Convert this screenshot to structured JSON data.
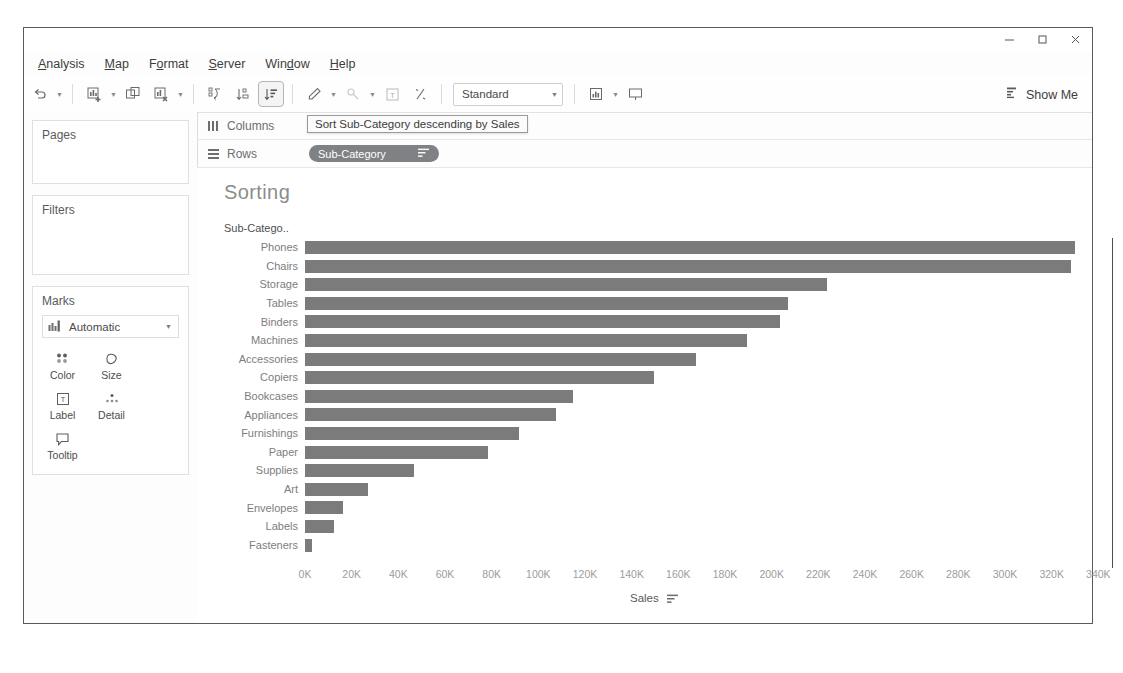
{
  "window": {
    "controls": [
      {
        "name": "minimize",
        "glyph": "—"
      },
      {
        "name": "maximize",
        "glyph": "❐"
      },
      {
        "name": "close",
        "glyph": "✕"
      }
    ]
  },
  "menubar": {
    "items": [
      {
        "label": "Analysis",
        "accel": "A"
      },
      {
        "label": "Map",
        "accel": "M"
      },
      {
        "label": "Format",
        "accel": "o"
      },
      {
        "label": "Server",
        "accel": "S"
      },
      {
        "label": "Window",
        "accel": "W"
      },
      {
        "label": "Help",
        "accel": "H"
      }
    ]
  },
  "toolbar": {
    "fit_value": "Standard",
    "show_me_label": "Show Me",
    "buttons": [
      {
        "name": "undo-button",
        "icon": "undo-icon"
      },
      {
        "name": "new-worksheet-button",
        "icon": "new-worksheet-icon"
      },
      {
        "name": "duplicate-sheet-button",
        "icon": "duplicate-sheet-icon"
      },
      {
        "name": "clear-sheet-button",
        "icon": "clear-sheet-icon"
      },
      {
        "name": "swap-rows-columns-button",
        "icon": "swap-icon"
      },
      {
        "name": "sort-ascending-button",
        "icon": "sort-ascending-icon"
      },
      {
        "name": "sort-descending-button",
        "icon": "sort-descending-icon"
      },
      {
        "name": "highlight-button",
        "icon": "highlighter-icon"
      },
      {
        "name": "group-members-button",
        "icon": "group-icon"
      },
      {
        "name": "show-mark-labels-button",
        "icon": "label-T-icon"
      },
      {
        "name": "presentation-fix-button",
        "icon": "fix-axes-icon"
      },
      {
        "name": "show-cards-button",
        "icon": "cards-icon"
      },
      {
        "name": "presentation-mode-button",
        "icon": "presentation-icon"
      }
    ]
  },
  "left_panel": {
    "pages_title": "Pages",
    "filters_title": "Filters",
    "marks_title": "Marks",
    "mark_type": "Automatic",
    "mark_buttons": [
      {
        "label": "Color",
        "icon": "color-dots-icon"
      },
      {
        "label": "Size",
        "icon": "size-icon"
      },
      {
        "label": "Label",
        "icon": "label-T-icon"
      },
      {
        "label": "Detail",
        "icon": "detail-icon"
      },
      {
        "label": "Tooltip",
        "icon": "tooltip-icon"
      }
    ]
  },
  "shelves": {
    "columns_label": "Columns",
    "rows_label": "Rows",
    "rows_pill": "Sub-Category",
    "tooltip": "Sort Sub-Category descending by Sales"
  },
  "viz": {
    "title": "Sorting",
    "row_header": "Sub-Catego..",
    "bar_color": "#7b7b7b"
  },
  "chart_data": {
    "type": "bar",
    "title": "Sorting",
    "orientation": "horizontal",
    "xlabel": "Sales",
    "ylabel": "Sub-Catego..",
    "xlim": [
      0,
      345000
    ],
    "xticks": [
      0,
      20000,
      40000,
      60000,
      80000,
      100000,
      120000,
      140000,
      160000,
      180000,
      200000,
      220000,
      240000,
      260000,
      280000,
      300000,
      320000,
      340000
    ],
    "xticklabels": [
      "0K",
      "20K",
      "40K",
      "60K",
      "80K",
      "100K",
      "120K",
      "140K",
      "160K",
      "180K",
      "200K",
      "220K",
      "240K",
      "260K",
      "280K",
      "300K",
      "320K",
      "340K"
    ],
    "grid": false,
    "legend": "none",
    "sort": "descending by Sales",
    "categories": [
      "Phones",
      "Chairs",
      "Storage",
      "Tables",
      "Binders",
      "Machines",
      "Accessories",
      "Copiers",
      "Bookcases",
      "Appliances",
      "Furnishings",
      "Paper",
      "Supplies",
      "Art",
      "Envelopes",
      "Labels",
      "Fasteners"
    ],
    "values": [
      330007,
      328449,
      223844,
      206966,
      203413,
      189239,
      167380,
      149528,
      114880,
      107532,
      91705,
      78479,
      46674,
      27119,
      16476,
      12486,
      3024
    ]
  }
}
